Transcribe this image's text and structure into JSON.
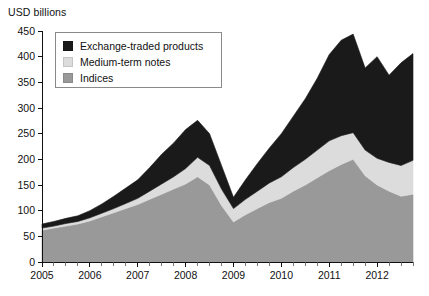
{
  "chart_data": {
    "type": "area",
    "stacked": true,
    "title": "",
    "subtitle": "",
    "ylabel": "USD billions",
    "xlabel": "",
    "ylim": [
      0,
      450
    ],
    "ytick_step": 50,
    "yticks": [
      0,
      50,
      100,
      150,
      200,
      250,
      300,
      350,
      400,
      450
    ],
    "xticks_major": [
      "2005",
      "2006",
      "2007",
      "2008",
      "2009",
      "2010",
      "2011",
      "2012"
    ],
    "x_minor_ticks_per_year": 4,
    "grid": false,
    "legend_position": "top-left-inside",
    "x": [
      "2005-Q1",
      "2005-Q2",
      "2005-Q3",
      "2005-Q4",
      "2006-Q1",
      "2006-Q2",
      "2006-Q3",
      "2006-Q4",
      "2007-Q1",
      "2007-Q2",
      "2007-Q3",
      "2007-Q4",
      "2008-Q1",
      "2008-Q2",
      "2008-Q3",
      "2008-Q4",
      "2009-Q1",
      "2009-Q2",
      "2009-Q3",
      "2009-Q4",
      "2010-Q1",
      "2010-Q2",
      "2010-Q3",
      "2010-Q4",
      "2011-Q1",
      "2011-Q2",
      "2011-Q3",
      "2011-Q4",
      "2012-Q1",
      "2012-Q2",
      "2012-Q3",
      "2012-Q4"
    ],
    "series": [
      {
        "name": "Indices",
        "color": "#999999",
        "values": [
          62,
          66,
          70,
          74,
          80,
          88,
          96,
          104,
          112,
          122,
          132,
          142,
          152,
          166,
          150,
          110,
          78,
          92,
          104,
          116,
          124,
          138,
          150,
          164,
          178,
          190,
          200,
          168,
          150,
          138,
          128,
          132
        ]
      },
      {
        "name": "Medium-term notes",
        "color": "#dcdcdc",
        "values": [
          4,
          4,
          5,
          5,
          6,
          7,
          8,
          10,
          12,
          16,
          20,
          24,
          30,
          38,
          38,
          32,
          26,
          30,
          34,
          38,
          42,
          46,
          50,
          54,
          58,
          56,
          52,
          50,
          52,
          56,
          60,
          66
        ]
      },
      {
        "name": "Exchange-traded products",
        "color": "#1a1a1a",
        "values": [
          8,
          9,
          10,
          11,
          14,
          18,
          24,
          30,
          36,
          46,
          58,
          66,
          76,
          72,
          62,
          46,
          22,
          38,
          54,
          68,
          84,
          100,
          118,
          140,
          168,
          186,
          192,
          160,
          198,
          170,
          200,
          208
        ]
      }
    ],
    "totals": [
      74,
      79,
      85,
      90,
      100,
      113,
      128,
      144,
      160,
      184,
      210,
      232,
      258,
      276,
      250,
      188,
      126,
      160,
      192,
      222,
      250,
      284,
      318,
      358,
      404,
      432,
      444,
      378,
      400,
      364,
      388,
      406
    ]
  },
  "legend": {
    "items": [
      {
        "label": "Exchange-traded products",
        "color": "#1a1a1a"
      },
      {
        "label": "Medium-term notes",
        "color": "#dcdcdc"
      },
      {
        "label": "Indices",
        "color": "#999999"
      }
    ]
  }
}
